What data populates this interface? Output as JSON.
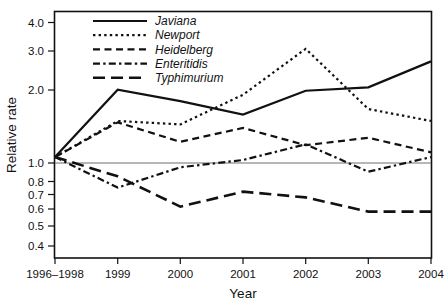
{
  "chart_data": {
    "type": "line",
    "title": "",
    "xlabel": "Year",
    "ylabel": "Relative rate",
    "x": [
      "1996–1998",
      "1999",
      "2000",
      "2001",
      "2002",
      "2003",
      "2004"
    ],
    "categories": [
      "1996–1998",
      "1999",
      "2000",
      "2001",
      "2002",
      "2003",
      "2004"
    ],
    "xtick_labels": [
      "1996–1998",
      "1999",
      "2000",
      "2001",
      "2002",
      "2003",
      "2004"
    ],
    "ytick_labels": [
      "0.4",
      "0.5",
      "0.6",
      "0.7",
      "0.8",
      "1.0",
      "2.0",
      "3.0",
      "4.0"
    ],
    "ytick_values": [
      0.4,
      0.5,
      0.6,
      0.7,
      0.8,
      1.0,
      2.0,
      3.0,
      4.0
    ],
    "yscale": "log",
    "ylim": [
      0.38,
      4.45
    ],
    "grid": false,
    "legend_position": "top-left-inside",
    "reference_line": 1.0,
    "series": [
      {
        "name": "Javiana",
        "style": "solid",
        "values": [
          1.0,
          2.0,
          1.78,
          1.55,
          1.98,
          2.05,
          2.68
        ]
      },
      {
        "name": "Newport",
        "style": "dotted",
        "values": [
          1.0,
          1.45,
          1.4,
          1.9,
          3.05,
          1.64,
          1.45
        ]
      },
      {
        "name": "Heidelberg",
        "style": "dashed",
        "values": [
          1.0,
          1.43,
          1.17,
          1.35,
          1.13,
          1.22,
          1.05
        ]
      },
      {
        "name": "Enteritidis",
        "style": "dash-dot",
        "values": [
          1.0,
          0.73,
          0.9,
          0.97,
          1.14,
          0.86,
          1.0
        ]
      },
      {
        "name": "Typhimurium",
        "style": "long-dash",
        "values": [
          1.0,
          0.82,
          0.6,
          0.7,
          0.66,
          0.57,
          0.57
        ]
      }
    ]
  },
  "legend": {
    "items": [
      {
        "label": "Javiana",
        "style": "solid"
      },
      {
        "label": "Newport",
        "style": "dotted"
      },
      {
        "label": "Heidelberg",
        "style": "dashed"
      },
      {
        "label": "Enteritidis",
        "style": "dash-dot"
      },
      {
        "label": "Typhimurium",
        "style": "long-dash"
      }
    ]
  },
  "axes": {
    "x_title": "Year",
    "y_title": "Relative rate"
  },
  "colors": {
    "ink": "#111111",
    "baseline": "#6e6e6e",
    "background": "#ffffff"
  }
}
